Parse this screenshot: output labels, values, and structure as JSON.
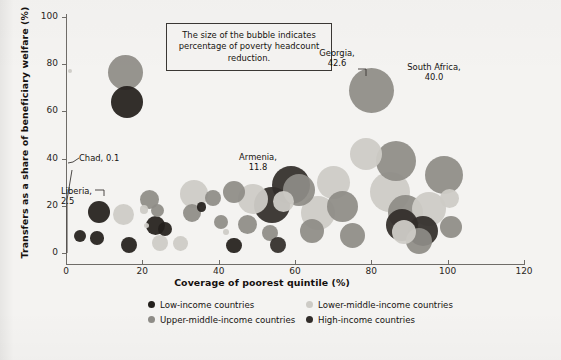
{
  "chart_data": {
    "type": "scatter",
    "title": "",
    "xlabel": "Coverage of poorest quintile (%)",
    "ylabel": "Transfers as a share of beneficiary welfare (%)",
    "xlim": [
      0,
      120
    ],
    "ylim": [
      0,
      100
    ],
    "xticks": [
      0,
      20,
      40,
      60,
      80,
      100,
      120
    ],
    "yticks": [
      0,
      20,
      40,
      60,
      80,
      100
    ],
    "grid": false,
    "size_note": "The size of the bubble indicates percentage of poverty headcount reduction.",
    "legend_position": "bottom",
    "series": [
      {
        "name": "Low-income countries",
        "color": "#231f1c",
        "points": [
          {
            "x": 16.0,
            "y": 64.0,
            "r": 16.0
          },
          {
            "x": 8.6,
            "y": 17.5,
            "r": 11.0
          },
          {
            "x": 3.6,
            "y": 7.2,
            "r": 6.2
          },
          {
            "x": 8.2,
            "y": 6.4,
            "r": 6.8
          },
          {
            "x": 16.5,
            "y": 3.6,
            "r": 8.0
          },
          {
            "x": 23.5,
            "y": 11.8,
            "r": 9.5
          },
          {
            "x": 26.0,
            "y": 10.0,
            "r": 7.0
          },
          {
            "x": 35.5,
            "y": 19.5,
            "r": 4.6
          },
          {
            "x": 44.0,
            "y": 3.2,
            "r": 7.6
          }
        ]
      },
      {
        "name": "Lower-middle-income countries",
        "color": "#cdcbc6",
        "points": [
          {
            "x": 1.0,
            "y": 77.0,
            "r": 2.2
          },
          {
            "x": 15.0,
            "y": 16.5,
            "r": 10.5
          },
          {
            "x": 20.5,
            "y": 18.5,
            "r": 4.2
          },
          {
            "x": 21.0,
            "y": 11.5,
            "r": 2.6
          },
          {
            "x": 24.5,
            "y": 4.2,
            "r": 8.0
          },
          {
            "x": 30.0,
            "y": 4.0,
            "r": 7.4
          },
          {
            "x": 33.5,
            "y": 25.0,
            "r": 14.0
          },
          {
            "x": 42.0,
            "y": 9.0,
            "r": 3.2
          },
          {
            "x": 49.0,
            "y": 23.0,
            "r": 15.0
          },
          {
            "x": 57.0,
            "y": 22.0,
            "r": 10.5
          },
          {
            "x": 66.0,
            "y": 17.0,
            "r": 17.0
          },
          {
            "x": 70.0,
            "y": 30.0,
            "r": 16.5
          },
          {
            "x": 78.5,
            "y": 42.0,
            "r": 16.0
          },
          {
            "x": 85.0,
            "y": 26.0,
            "r": 20.0
          },
          {
            "x": 88.5,
            "y": 9.0,
            "r": 12.0
          },
          {
            "x": 95.0,
            "y": 18.5,
            "r": 17.0
          },
          {
            "x": 100.5,
            "y": 23.0,
            "r": 9.5
          }
        ]
      },
      {
        "name": "Upper-middle-income countries",
        "color": "#8e8c87",
        "points": [
          {
            "x": 15.7,
            "y": 76.5,
            "r": 17.5
          },
          {
            "x": 22.0,
            "y": 22.5,
            "r": 9.5
          },
          {
            "x": 24.0,
            "y": 18.0,
            "r": 6.5
          },
          {
            "x": 33.0,
            "y": 17.0,
            "r": 9.0
          },
          {
            "x": 38.5,
            "y": 23.5,
            "r": 8.0
          },
          {
            "x": 40.5,
            "y": 13.0,
            "r": 7.0
          },
          {
            "x": 44.0,
            "y": 26.0,
            "r": 11.0
          },
          {
            "x": 47.5,
            "y": 12.0,
            "r": 9.5
          },
          {
            "x": 53.5,
            "y": 8.5,
            "r": 8.0
          },
          {
            "x": 61.0,
            "y": 26.5,
            "r": 16.0
          },
          {
            "x": 64.5,
            "y": 9.5,
            "r": 12.0
          },
          {
            "x": 72.5,
            "y": 19.5,
            "r": 15.5
          },
          {
            "x": 75.0,
            "y": 7.5,
            "r": 12.5
          },
          {
            "x": 80.0,
            "y": 69.0,
            "r": 22.5
          },
          {
            "x": 86.5,
            "y": 39.0,
            "r": 20.0
          },
          {
            "x": 89.0,
            "y": 17.0,
            "r": 17.5
          },
          {
            "x": 92.5,
            "y": 5.0,
            "r": 13.0
          },
          {
            "x": 99.0,
            "y": 33.0,
            "r": 19.0
          },
          {
            "x": 101.0,
            "y": 11.0,
            "r": 11.0
          }
        ]
      },
      {
        "name": "High-income countries",
        "color": "#322d2a",
        "points": [
          {
            "x": 54.0,
            "y": 20.5,
            "r": 18.0
          },
          {
            "x": 59.0,
            "y": 29.0,
            "r": 19.0
          },
          {
            "x": 55.5,
            "y": 3.5,
            "r": 8.0
          },
          {
            "x": 88.0,
            "y": 12.0,
            "r": 16.0
          },
          {
            "x": 93.5,
            "y": 9.5,
            "r": 15.0
          }
        ]
      }
    ],
    "annotations": [
      {
        "name": "chad",
        "label": "Chad, 0.1",
        "value": 0.1,
        "x": 0.0,
        "y": 2.5
      },
      {
        "name": "liberia",
        "label": "Liberia,\n2.5",
        "value": 2.5,
        "x": 0.2,
        "y": 20.0
      },
      {
        "name": "armenia",
        "label": "Armenia,\n11.8",
        "value": 11.8,
        "x": 56.0,
        "y": 33.0
      },
      {
        "name": "georgia",
        "label": "Georgia,\n42.6",
        "value": 42.6,
        "x": 80.0,
        "y": 69.0
      },
      {
        "name": "south-africa",
        "label": "South Africa,\n40.0",
        "value": 40.0,
        "x": 88.0,
        "y": 74.0
      }
    ]
  },
  "axis": {
    "x_title": "Coverage of poorest quintile (%)",
    "y_title": "Transfers as a share of beneficiary welfare (%)",
    "x_ticks": [
      "0",
      "20",
      "40",
      "60",
      "80",
      "100",
      "120"
    ],
    "y_ticks": [
      "0",
      "20",
      "40",
      "60",
      "80",
      "100"
    ]
  },
  "callout": {
    "text": "The size of the bubble indicates percentage of poverty headcount reduction."
  },
  "labels": {
    "chad": "Chad, 0.1",
    "liberia": "Liberia,\n2.5",
    "armenia": "Armenia,\n11.8",
    "georgia": "Georgia,\n42.6",
    "south_africa": "South Africa,\n40.0"
  },
  "legend": {
    "items": [
      {
        "label": "Low-income countries",
        "color": "#231f1c"
      },
      {
        "label": "Lower-middle-income countries",
        "color": "#cdcbc6"
      },
      {
        "label": "Upper-middle-income countries",
        "color": "#8e8c87"
      },
      {
        "label": "High-income countries",
        "color": "#322d2a"
      }
    ]
  },
  "colors": {
    "background": "#f4f3f1",
    "axis": "#6f6c68",
    "text": "#15120f"
  }
}
